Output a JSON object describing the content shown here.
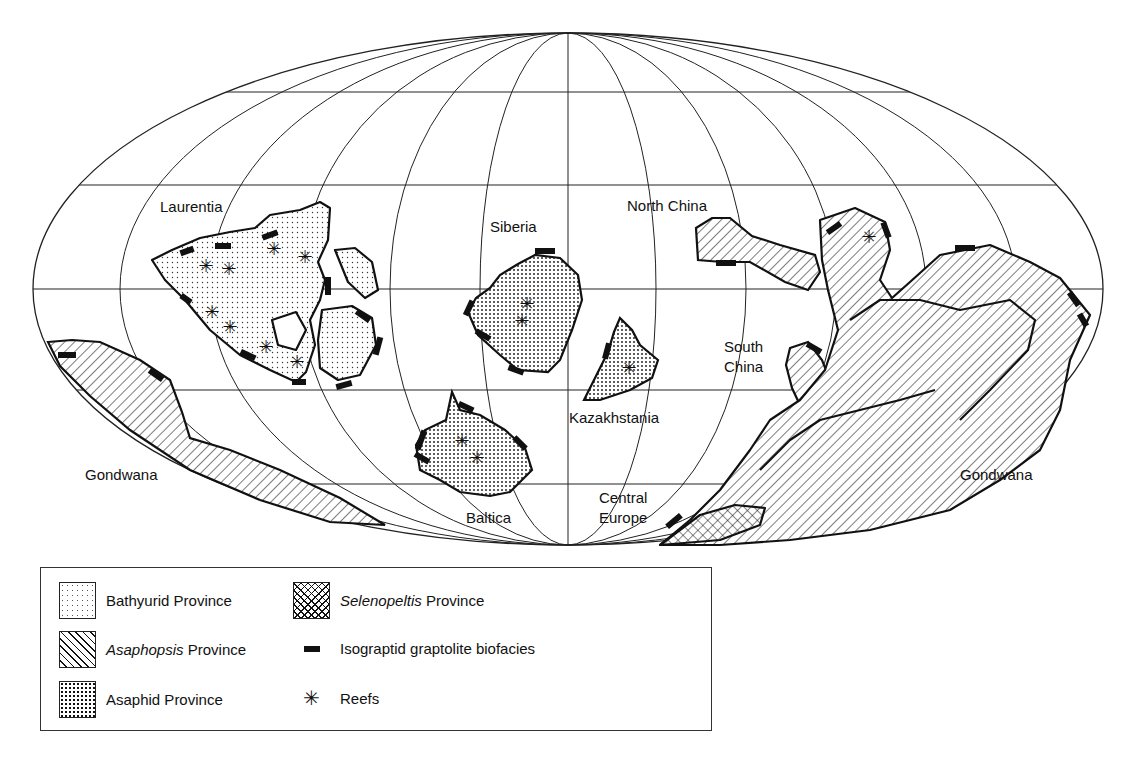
{
  "map": {
    "projection": "Mollweide (oval graticule)",
    "labels": {
      "laurentia": "Laurentia",
      "siberia": "Siberia",
      "north_china": "North China",
      "south_china_1": "South",
      "south_china_2": "China",
      "kazakhstania": "Kazakhstania",
      "baltica": "Baltica",
      "central_europe_1": "Central",
      "central_europe_2": "Europe",
      "gondwana_west": "Gondwana",
      "gondwana_east": "Gondwana"
    },
    "colors": {
      "ink": "#111111",
      "paper": "#ffffff"
    }
  },
  "legend": {
    "items": [
      {
        "pattern": "fine-dots",
        "label_italic": "",
        "label": "Bathyurid Province"
      },
      {
        "pattern": "diagonal-hatch",
        "label_italic": "Asaphopsis",
        "label": " Province"
      },
      {
        "pattern": "coarse-dots",
        "label_italic": "",
        "label": "Asaphid Province"
      },
      {
        "pattern": "cross-hatch",
        "label_italic": "Selenopeltis",
        "label": " Province"
      },
      {
        "symbol": "black-bar",
        "label": "Isograptid graptolite biofacies"
      },
      {
        "symbol": "asterisk",
        "glyph": "✳",
        "label": "Reefs"
      }
    ]
  }
}
